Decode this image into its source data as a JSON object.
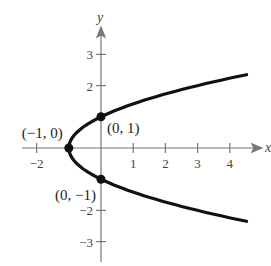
{
  "chart_data": {
    "type": "line",
    "title": "",
    "equation": "x = y^2 - 1",
    "xlabel": "x",
    "ylabel": "y",
    "xlim": [
      -2.5,
      4.9
    ],
    "ylim": [
      -3.5,
      3.9
    ],
    "x_ticks": [
      -2,
      1,
      2,
      3,
      4
    ],
    "x_tick_labels": [
      "−2",
      "1",
      "2",
      "3",
      "4"
    ],
    "y_ticks": [
      3,
      2,
      -2,
      -3
    ],
    "y_tick_labels": [
      "3",
      "2",
      "−2",
      "−3"
    ],
    "grid": false,
    "series": [
      {
        "name": "parabola",
        "x_of_y": "y^2 - 1",
        "y_range": [
          -2.35,
          2.35
        ]
      }
    ],
    "points": [
      {
        "x": -1,
        "y": 0,
        "label": "(−1, 0)"
      },
      {
        "x": 0,
        "y": 1,
        "label": "(0, 1)"
      },
      {
        "x": 0,
        "y": -1,
        "label": "(0, −1)"
      }
    ]
  }
}
